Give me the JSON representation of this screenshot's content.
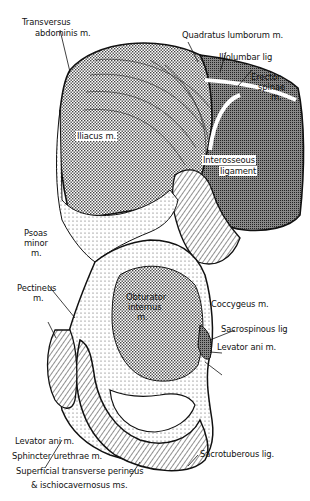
{
  "figure": {
    "colors": {
      "ink": "#111111",
      "paper": "#ffffff",
      "stipple": "#9a9a9a"
    }
  },
  "labels": {
    "transversus_abdominis": [
      "Transversus",
      "abdominis m."
    ],
    "quadratus_lumborum": "Quadratus lumborum m.",
    "iliolumbar": "Iliolumbar lig",
    "erector_spinae": [
      "Erector",
      "spinae",
      "m."
    ],
    "iliacus": "Iliacus m.",
    "interosseous": [
      "Interosseous",
      "ligament"
    ],
    "psoas_minor": [
      "Psoas",
      "minor",
      "m."
    ],
    "pectineus": [
      "Pectineus",
      "m."
    ],
    "obturator_internus": [
      "Obturator",
      "internus",
      "m."
    ],
    "coccygeus": "Coccygeus m.",
    "sacrospinous": "Sacrospinous lig",
    "levator_ani_right": "Levator ani m.",
    "levator_ani_left": "Levator ani m.",
    "sphincter_urethrae": "Sphincter urethrae m.",
    "sacrotuberous": "Sacrotuberous lig.",
    "superficial_transverse": [
      "Superficial transverse perineus",
      "& ischiocavernosus ms."
    ]
  }
}
